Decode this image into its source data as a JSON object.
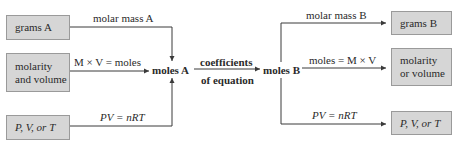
{
  "diagram": {
    "left_boxes": [
      {
        "id": "grams-a",
        "lines": [
          "grams A"
        ]
      },
      {
        "id": "molarity-and-volume",
        "lines": [
          "molarity",
          "and volume"
        ]
      },
      {
        "id": "pvt-a",
        "lines": [
          "P, V, or T"
        ]
      }
    ],
    "left_arrows": [
      {
        "from": "grams A",
        "to": "moles A",
        "label": "molar mass A"
      },
      {
        "from": "molarity and volume",
        "to": "moles A",
        "label": "M × V = moles"
      },
      {
        "from": "P, V, or T",
        "to": "moles A",
        "label": "PV = nRT"
      }
    ],
    "center": {
      "moles_a": "moles A",
      "conversion_label_top": "coefficients",
      "conversion_label_bottom": "of equation",
      "moles_b": "moles B"
    },
    "right_arrows": [
      {
        "from": "moles B",
        "to": "grams B",
        "label": "molar mass B"
      },
      {
        "from": "moles B",
        "to": "molarity or volume",
        "label": "moles = M × V"
      },
      {
        "from": "moles B",
        "to": "P, V, or T",
        "label": "PV = nRT"
      }
    ],
    "right_boxes": [
      {
        "id": "grams-b",
        "lines": [
          "grams B"
        ]
      },
      {
        "id": "molarity-or-volume",
        "lines": [
          "molarity",
          "or volume"
        ]
      },
      {
        "id": "pvt-b",
        "lines": [
          "P, V, or T"
        ]
      }
    ],
    "colors": {
      "box_fill": "#d6d6d6",
      "box_border": "#9a9a9a",
      "line": "#3a3a3a",
      "text": "#2a2a2a"
    }
  }
}
